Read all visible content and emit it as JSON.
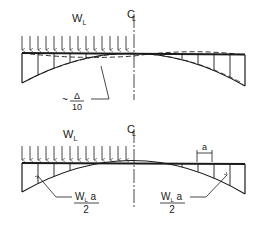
{
  "diagram": {
    "top": {
      "load_label": "W",
      "load_subscript": "L",
      "centerline_label": "C",
      "centerline_subscript": "L",
      "deflection_prefix": "~",
      "deflection_numerator": "Δ",
      "deflection_denominator": "10"
    },
    "bottom": {
      "load_label": "W",
      "load_subscript": "L",
      "centerline_label": "C",
      "centerline_subscript": "L",
      "spacing_label": "a",
      "left_force_numerator": "W",
      "left_force_numerator_sub": "L",
      "left_force_numerator_tail": " a",
      "left_force_denominator": "2",
      "right_force_numerator": "W",
      "right_force_numerator_sub": "L",
      "right_force_numerator_tail": " a",
      "right_force_denominator": "2"
    },
    "colors": {
      "ink": "#1a1a1a",
      "background": "#ffffff"
    }
  }
}
